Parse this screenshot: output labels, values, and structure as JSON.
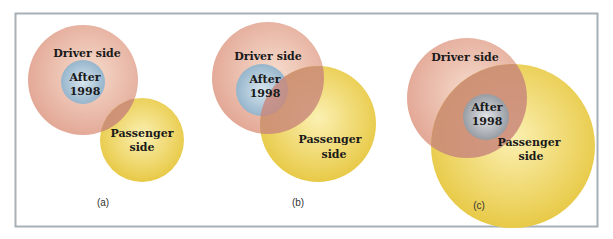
{
  "figure": {
    "colors": {
      "frame": "#a7b0b6",
      "driver": "#e2a593",
      "driver_highlight": "#f6dccd",
      "passenger": "#e6c63d",
      "passenger_highlight": "#fbf0b2",
      "after_blue": "#9dbad0",
      "after_blue_highlight": "#d8e6ef",
      "after_gray": "#9a9fa6",
      "after_gray_highlight": "#dfe1e4",
      "overlap": "#c9877a"
    },
    "panels": [
      {
        "id": "a",
        "caption": "(a)",
        "driver_label": "Driver side",
        "after_label_line1": "After",
        "after_label_line2": "1998",
        "passenger_label_line1": "Passenger",
        "passenger_label_line2": "side",
        "relationship": "After 1998 entirely within Driver side; Driver side and Passenger side partially overlap"
      },
      {
        "id": "b",
        "caption": "(b)",
        "driver_label": "Driver side",
        "after_label_line1": "After",
        "after_label_line2": "1998",
        "passenger_label_line1": "Passenger",
        "passenger_label_line2": "side",
        "relationship": "After 1998 within Driver side and partially overlapping Passenger side"
      },
      {
        "id": "c",
        "caption": "(c)",
        "driver_label": "Driver side",
        "after_label_line1": "After",
        "after_label_line2": "1998",
        "passenger_label_line1": "Passenger",
        "passenger_label_line2": "side",
        "relationship": "After 1998 entirely within the intersection of Driver side and Passenger side"
      }
    ]
  }
}
